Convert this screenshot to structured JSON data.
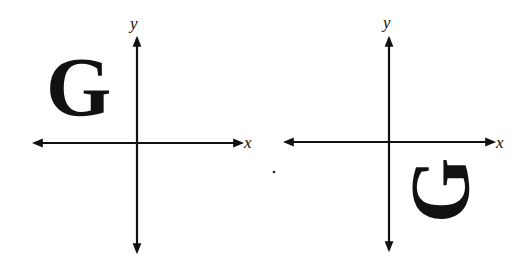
{
  "diagram": {
    "panels": [
      {
        "name": "original",
        "x_label": "x",
        "y_label": "y",
        "letter": "G",
        "quadrant": "II",
        "rotation_deg": 0
      },
      {
        "name": "image",
        "x_label": "x",
        "y_label": "y",
        "letter": "G",
        "quadrant": "IV",
        "rotation_deg": -90
      }
    ],
    "colors": {
      "ink": "#111111",
      "background": "#ffffff"
    }
  }
}
